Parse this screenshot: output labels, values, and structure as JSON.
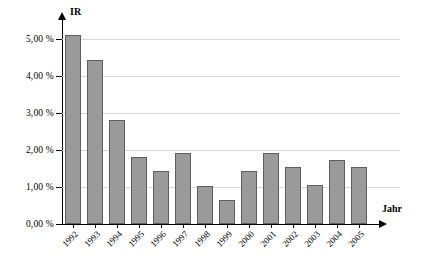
{
  "chart_data": {
    "type": "bar",
    "title": "",
    "xlabel": "Jahr",
    "ylabel": "IR",
    "categories": [
      "1992",
      "1993",
      "1994",
      "1995",
      "1996",
      "1997",
      "1998",
      "1999",
      "2000",
      "2001",
      "2002",
      "2003",
      "2004",
      "2005"
    ],
    "values": [
      5.1,
      4.42,
      2.8,
      1.82,
      1.42,
      1.92,
      1.02,
      0.64,
      1.42,
      1.92,
      1.55,
      1.04,
      1.74,
      1.54
    ],
    "value_unit": "%",
    "ylim": [
      0,
      5.4
    ],
    "yticks": [
      0,
      1,
      2,
      3,
      4,
      5
    ],
    "ytick_labels": [
      "0,00 %",
      "1,00 %",
      "2,00 %",
      "3,00 %",
      "4,00 %",
      "5,00 %"
    ],
    "grid": true,
    "legend": false,
    "legend_position": "none",
    "bar_color": "#9a9a9a",
    "bar_border_color": "#5e5e5e",
    "grid_color": "#d8d8d8",
    "axis_color": "#000000",
    "background": "#ffffff"
  },
  "axes": {
    "y_title": "IR",
    "x_title": "Jahr"
  }
}
